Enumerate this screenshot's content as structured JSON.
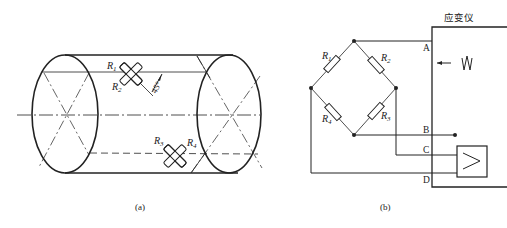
{
  "figure_a": {
    "caption": "(a)",
    "gauge_labels": {
      "r1": "R",
      "r1_sub": "1",
      "r2": "R",
      "r2_sub": "2",
      "r3": "R",
      "r3_sub": "3",
      "r4": "R",
      "r4_sub": "4"
    },
    "angle_label": "45°",
    "description": "Cylindrical shaft with strain gauges R1/R2 and R3/R4 mounted at 45° to the axis"
  },
  "figure_b": {
    "caption": "(b)",
    "instrument_label": "应变仪",
    "terminals": [
      "A",
      "B",
      "C",
      "D"
    ],
    "resistor_labels": {
      "r1": "R",
      "r1_sub": "1",
      "r2": "R",
      "r2_sub": "2",
      "r3": "R",
      "r3_sub": "3",
      "r4": "R",
      "r4_sub": "4"
    },
    "description": "Full Wheatstone bridge connected to strain meter with AC excitation and amplifier"
  },
  "colors": {
    "line": "#222222",
    "background": "#ffffff"
  }
}
